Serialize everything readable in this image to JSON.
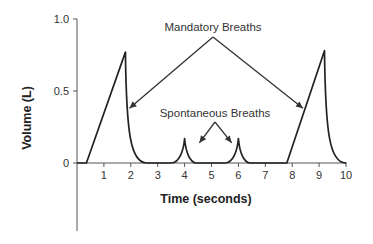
{
  "chart_data": {
    "type": "line",
    "title": "",
    "xlabel": "Time (seconds)",
    "ylabel": "Volume (L)",
    "xlim": [
      0,
      10
    ],
    "ylim": [
      0,
      1.0
    ],
    "x_ticks": [
      "1",
      "2",
      "3",
      "4",
      "5",
      "6",
      "7",
      "8",
      "9",
      "10"
    ],
    "y_ticks": [
      "0",
      "0.5",
      "1.0"
    ],
    "y_tick_values": [
      0,
      0.5,
      1.0
    ],
    "x_tick_values": [
      1,
      2,
      3,
      4,
      5,
      6,
      7,
      8,
      9,
      10
    ],
    "grid": false,
    "series": [
      {
        "name": "Volume",
        "breaths": [
          {
            "kind": "mandatory",
            "start": 0.35,
            "peak_time": 1.8,
            "peak_volume": 0.77,
            "end": 2.6
          },
          {
            "kind": "spontaneous",
            "start": 3.5,
            "peak_time": 4.0,
            "peak_volume": 0.17,
            "end": 4.45
          },
          {
            "kind": "spontaneous",
            "start": 5.5,
            "peak_time": 6.0,
            "peak_volume": 0.17,
            "end": 6.45
          },
          {
            "kind": "mandatory",
            "start": 7.8,
            "peak_time": 9.2,
            "peak_volume": 0.78,
            "end": 10.0
          }
        ]
      }
    ],
    "annotations": [
      {
        "text": "Mandatory Breaths",
        "targets": [
          {
            "t": 1.95,
            "v": 0.38
          },
          {
            "t": 8.4,
            "v": 0.38
          }
        ]
      },
      {
        "text": "Spontaneous Breaths",
        "targets": [
          {
            "t": 4.55,
            "v": 0.14
          },
          {
            "t": 5.75,
            "v": 0.14
          }
        ]
      }
    ]
  }
}
